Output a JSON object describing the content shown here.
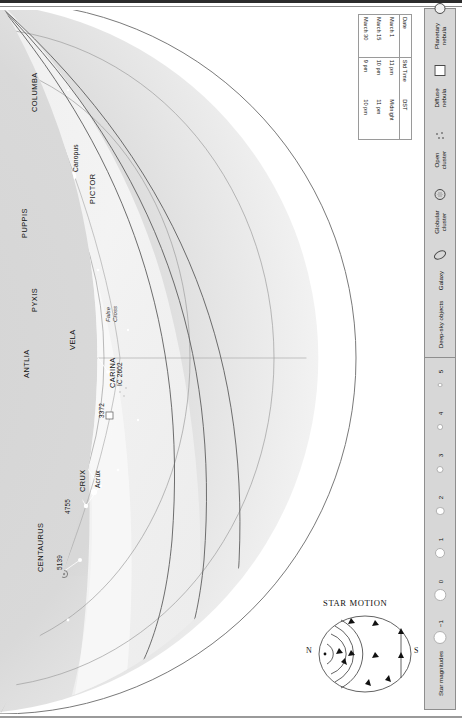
{
  "chart": {
    "cardinals": [
      {
        "name": "WEST",
        "x": 252,
        "y": 52,
        "rot": 200
      },
      {
        "name": "SOUTH",
        "x": 379,
        "y": 386,
        "rot": -90
      },
      {
        "name": "EAST",
        "x": 232,
        "y": 664,
        "rot": -22
      }
    ],
    "constellations": [
      {
        "label": "ERIDANUS",
        "x": 62,
        "y": 84,
        "rot": -90
      },
      {
        "label": "ORION",
        "x": 128,
        "y": 140,
        "rot": -90
      },
      {
        "label": "LEPUS",
        "x": 176,
        "y": 92,
        "rot": -90
      },
      {
        "label": "COLUMBA",
        "x": 262,
        "y": 112,
        "rot": -90
      },
      {
        "label": "MONOCEROS",
        "x": 153,
        "y": 196,
        "rot": -90
      },
      {
        "label": "CANIS\nMAJOR",
        "x": 210,
        "y": 168,
        "rot": -90
      },
      {
        "label": "GEMINI",
        "x": 58,
        "y": 222,
        "rot": -90
      },
      {
        "label": "CANIS\nMINOR",
        "x": 95,
        "y": 251,
        "rot": -90
      },
      {
        "label": "CANCER",
        "x": 80,
        "y": 292,
        "rot": -90
      },
      {
        "label": "PUPPIS",
        "x": 252,
        "y": 238,
        "rot": -90
      },
      {
        "label": "PICTOR",
        "x": 320,
        "y": 204,
        "rot": -90
      },
      {
        "label": "PYXIS",
        "x": 262,
        "y": 312,
        "rot": -90
      },
      {
        "label": "LEO\nMINOR",
        "x": 35,
        "y": 382,
        "rot": -90
      },
      {
        "label": "LEO",
        "x": 72,
        "y": 424,
        "rot": -90
      },
      {
        "label": "SEXTANS",
        "x": 152,
        "y": 392,
        "rot": -90
      },
      {
        "label": "HYDRA",
        "x": 208,
        "y": 386,
        "rot": -90
      },
      {
        "label": "ANTLIA",
        "x": 254,
        "y": 378,
        "rot": -90
      },
      {
        "label": "VELA",
        "x": 300,
        "y": 350,
        "rot": -90
      },
      {
        "label": "CARINA",
        "x": 340,
        "y": 388,
        "rot": -90
      },
      {
        "label": "COMA\nBERENICES",
        "x": 18,
        "y": 498,
        "rot": -90
      },
      {
        "label": "CRATER",
        "x": 198,
        "y": 470,
        "rot": -90
      },
      {
        "label": "CORVUS",
        "x": 166,
        "y": 518,
        "rot": -90
      },
      {
        "label": "VIRGO",
        "x": 72,
        "y": 560,
        "rot": -90
      },
      {
        "label": "CRUX",
        "x": 310,
        "y": 492,
        "rot": -90
      },
      {
        "label": "CENTAURUS",
        "x": 268,
        "y": 572,
        "rot": -90
      },
      {
        "label": "LIBRA",
        "x": 52,
        "y": 668,
        "rot": -90
      }
    ],
    "stars": [
      {
        "label": "Rigel",
        "x": 122,
        "y": 80,
        "rot": -90
      },
      {
        "label": "Betelgeuse",
        "x": 95,
        "y": 172,
        "rot": -90
      },
      {
        "label": "Sirius",
        "x": 184,
        "y": 172,
        "rot": -90
      },
      {
        "label": "Canopus",
        "x": 304,
        "y": 172,
        "rot": -90
      },
      {
        "label": "Procyon",
        "x": 118,
        "y": 228,
        "rot": -90
      },
      {
        "label": "Castor",
        "x": 50,
        "y": 262,
        "rot": -90
      },
      {
        "label": "Pollux",
        "x": 62,
        "y": 278,
        "rot": -90
      },
      {
        "label": "Regulus",
        "x": 58,
        "y": 414,
        "rot": -90
      },
      {
        "label": "Acrux",
        "x": 326,
        "y": 488,
        "rot": -90
      },
      {
        "label": "Spica",
        "x": 98,
        "y": 576,
        "rot": -90
      }
    ],
    "deep_sky_labels": [
      {
        "label": "M42",
        "x": 106,
        "y": 126,
        "rot": -90
      },
      {
        "label": "2244",
        "x": 100,
        "y": 194,
        "rot": -90
      },
      {
        "label": "M41",
        "x": 198,
        "y": 164,
        "rot": -90
      },
      {
        "label": "M44",
        "x": 67,
        "y": 288,
        "rot": -90
      },
      {
        "label": "3372",
        "x": 330,
        "y": 418,
        "rot": -90
      },
      {
        "label": "IC 2602",
        "x": 348,
        "y": 386,
        "rot": -90
      },
      {
        "label": "4755",
        "x": 296,
        "y": 514,
        "rot": -90
      },
      {
        "label": "5139",
        "x": 288,
        "y": 570,
        "rot": -90
      }
    ],
    "asterisms": [
      {
        "label": "False\nCross",
        "x": 336,
        "y": 322,
        "rot": -90
      }
    ],
    "declinations": [
      {
        "label": "40°N",
        "x": 8,
        "y": 318,
        "rot": -75
      },
      {
        "label": "20°N",
        "x": 12,
        "y": 358,
        "rot": -75
      },
      {
        "label": "0°",
        "x": 68,
        "y": 368,
        "rot": -70
      }
    ],
    "horizon_labels": [
      {
        "label": "Horizon 60°N",
        "x": 140,
        "y": 556,
        "rot": -52
      },
      {
        "label": "Horizon 40°N",
        "x": 160,
        "y": 604,
        "rot": -44
      },
      {
        "label": "Horizon 20°N",
        "x": 172,
        "y": 662,
        "rot": -30
      }
    ],
    "ecliptic_label": {
      "label": "Ecliptic",
      "x": 84,
      "y": 648,
      "rot": -52
    }
  },
  "date_table": {
    "headers": [
      "Date",
      "Std Time",
      "DST"
    ],
    "rows": [
      [
        "March 1",
        "11 pm",
        "Midnight"
      ],
      [
        "March 15",
        "10 pm",
        "11 pm"
      ],
      [
        "March 30",
        "9 pm",
        "10 pm"
      ]
    ]
  },
  "legend": {
    "deep_sky": {
      "title": "Deep-sky objects",
      "items": [
        {
          "label": "Galaxy",
          "icon": "galaxy-icon"
        },
        {
          "label": "Globular\ncluster",
          "icon": "globular-cluster-icon"
        },
        {
          "label": "Open\ncluster",
          "icon": "open-cluster-icon"
        },
        {
          "label": "Diffuse\nnebula",
          "icon": "diffuse-nebula-icon"
        },
        {
          "label": "Planetary\nnebula",
          "icon": "planetary-nebula-icon"
        }
      ]
    },
    "magnitudes": {
      "title": "Star magnitudes",
      "values": [
        "−1",
        "0",
        "1",
        "2",
        "3",
        "4",
        "5"
      ],
      "dot_sizes": [
        11,
        9.5,
        8,
        6.5,
        5,
        3.8,
        2.8
      ]
    }
  },
  "star_motion": {
    "title": "STAR MOTION",
    "north_label": "N",
    "south_label": "S"
  },
  "colors": {
    "sky_fill": "#d6d6d6",
    "sky_outer": "#ffffff",
    "milky_way": "#eaeaea",
    "star_fill": "#ffffff",
    "line": "#6f6f6f",
    "text": "#111111",
    "rail_bg": "#d7d7d7",
    "gutter": "#2c2c2c"
  }
}
